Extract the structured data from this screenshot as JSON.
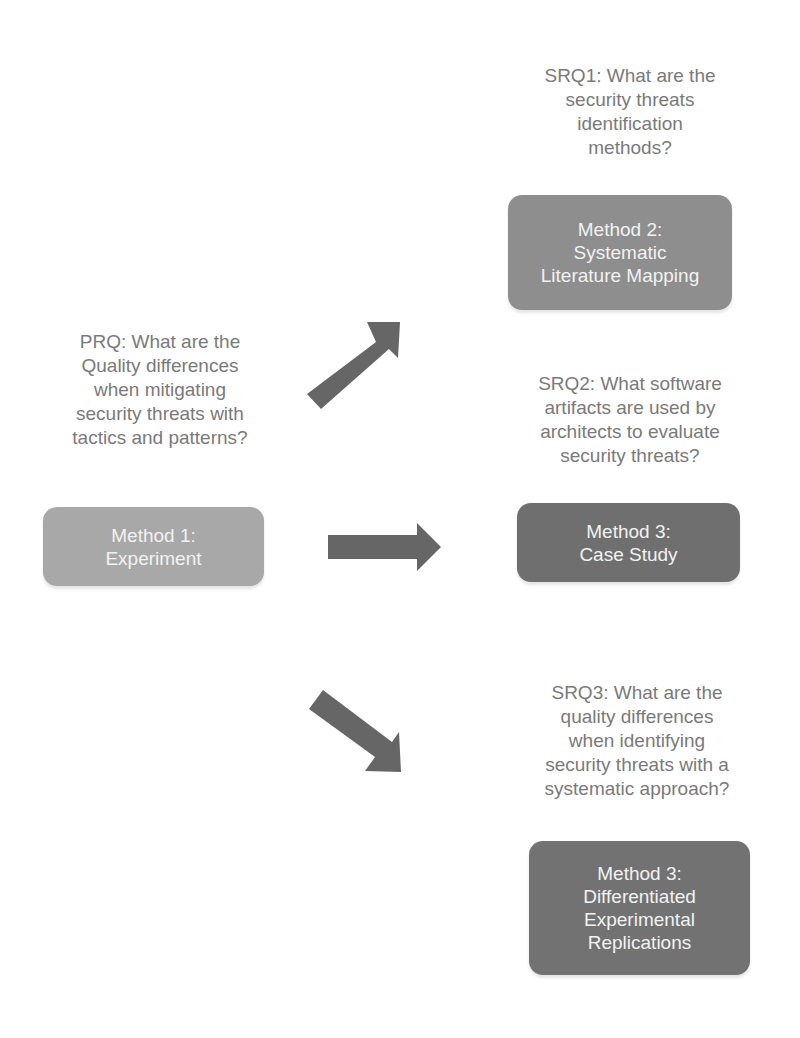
{
  "diagram": {
    "primary_question": {
      "text": "PRQ: What are the\nQuality differences\nwhen mitigating\nsecurity threats with\ntactics and patterns?"
    },
    "method1": {
      "label": "Method 1:\nExperiment"
    },
    "sub_questions": [
      {
        "id": "SRQ1",
        "text": "SRQ1: What are the\nsecurity threats\nidentification\nmethods?",
        "method_label": "Method 2:\nSystematic\nLiterature Mapping"
      },
      {
        "id": "SRQ2",
        "text": "SRQ2: What software\nartifacts are used by\narchitects to evaluate\nsecurity threats?",
        "method_label": "Method 3:\nCase Study"
      },
      {
        "id": "SRQ3",
        "text": "SRQ3: What are the\nquality differences\nwhen identifying\nsecurity threats with a\nsystematic approach?",
        "method_label": "Method 3:\nDifferentiated\nExperimental\nReplications"
      }
    ],
    "arrows": [
      {
        "from": "primary",
        "to": "SRQ1",
        "direction": "up-right"
      },
      {
        "from": "primary",
        "to": "SRQ2",
        "direction": "right"
      },
      {
        "from": "primary",
        "to": "SRQ3",
        "direction": "down-right"
      }
    ],
    "colors": {
      "question_text": "#7a7a7a",
      "method1_fill": "#a8a8a8",
      "method2_fill": "#8e8e8e",
      "method3_fill": "#6f6f6f",
      "arrow_fill": "#666666",
      "box_text": "#f2f2f2"
    }
  }
}
